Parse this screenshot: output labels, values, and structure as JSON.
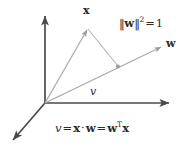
{
  "figure": {
    "background_color": "#ffffff",
    "axis_color": "#4a4a4a",
    "vector_color": "#a8a8a8",
    "text_color": "#2b2b2b",
    "width": 196,
    "height": 153
  },
  "labels": {
    "x_vector": "x",
    "w_vector": "w",
    "projection_scalar": "v"
  },
  "equations": {
    "norm": {
      "left_bars": "‖",
      "vector": "w",
      "right_bars": "‖",
      "exponent": "2",
      "equals": "=",
      "value": "1",
      "plain": "‖w‖² = 1"
    },
    "projection": {
      "scalar": "v",
      "equals_1": "=",
      "x": "x",
      "dot": "·",
      "w": "w",
      "equals_2": "=",
      "w_transpose": "w",
      "transpose": "T",
      "x_end": "x",
      "plain": "v = x · w = wᵀx"
    }
  },
  "geometry": {
    "origin": {
      "x": 45,
      "y": 103
    },
    "axes": [
      {
        "name": "vertical-axis",
        "x1": 45,
        "y1": 103,
        "x2": 45,
        "y2": 14
      },
      {
        "name": "horizontal-axis",
        "x1": 45,
        "y1": 103,
        "x2": 171,
        "y2": 103
      },
      {
        "name": "depth-axis",
        "x1": 45,
        "y1": 103,
        "x2": 11,
        "y2": 142
      }
    ],
    "vectors": [
      {
        "name": "x-vector",
        "x1": 45,
        "y1": 103,
        "x2": 88,
        "y2": 28
      },
      {
        "name": "w-vector",
        "x1": 45,
        "y1": 103,
        "x2": 163,
        "y2": 46
      }
    ],
    "projection_line": {
      "x1": 88,
      "y1": 28,
      "x2": 118,
      "y2": 67
    },
    "projection_point": {
      "x": 118,
      "y": 67
    }
  }
}
